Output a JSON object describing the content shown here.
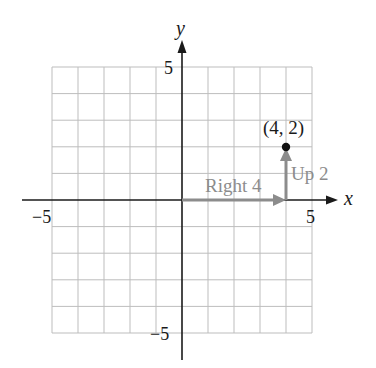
{
  "diagram": {
    "type": "coordinate-plane",
    "x_axis": {
      "label": "x",
      "min": -5,
      "max": 5,
      "tick_labels": [
        "-5",
        "5"
      ]
    },
    "y_axis": {
      "label": "y",
      "min": -5,
      "max": 5,
      "tick_labels": [
        "5",
        "-5"
      ]
    },
    "point": {
      "label": "(4, 2)",
      "x": 4,
      "y": 2
    },
    "moves": [
      {
        "label": "Right 4",
        "from": [
          0,
          0
        ],
        "to": [
          4,
          0
        ]
      },
      {
        "label": "Up 2",
        "from": [
          4,
          0
        ],
        "to": [
          4,
          2
        ]
      }
    ],
    "colors": {
      "grid": "#b8b8b8",
      "axis": "#1a1a1a",
      "move_arrow": "#8c8c8c",
      "move_label": "#8c8c8c",
      "point": "#111111"
    }
  },
  "labels": {
    "y_axis_name": "y",
    "x_axis_name": "x",
    "y_tick_top": "5",
    "y_tick_bottom": "−5",
    "x_tick_left": "−5",
    "x_tick_right": "5",
    "point_label": "(4, 2)",
    "right_label": "Right 4",
    "up_label": "Up 2"
  }
}
